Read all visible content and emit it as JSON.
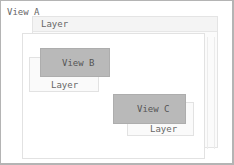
{
  "diagram": {
    "view_a": {
      "label": "View A",
      "layer_label": "Layer"
    },
    "view_b": {
      "label": "View B",
      "layer_label": "Layer"
    },
    "view_c": {
      "label": "View C",
      "layer_label": "Layer"
    }
  },
  "colors": {
    "view_fill": "#b9b9b9",
    "layer_fill": "#fafafa",
    "border": "#b4b4b4",
    "text": "#666666"
  }
}
